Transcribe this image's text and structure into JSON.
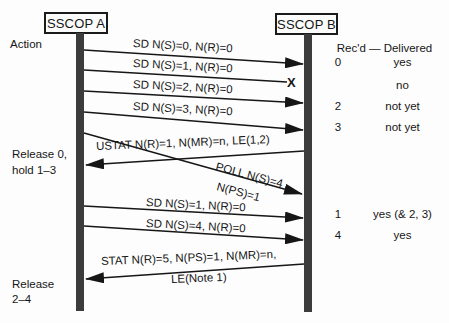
{
  "diagram": {
    "actors": [
      {
        "label": "SSCOP A"
      },
      {
        "label": "SSCOP B"
      }
    ],
    "left_labels": {
      "action": "Action",
      "release_hold_line1": "Release 0,",
      "release_hold_line2": "hold 1–3",
      "release2_line1": "Release",
      "release2_line2": "2–4"
    },
    "messages": [
      {
        "label": "SD N(S)=0, N(R)=0"
      },
      {
        "label": "SD N(S)=1, N(R)=0"
      },
      {
        "label": "SD N(S)=2, N(R)=0"
      },
      {
        "label": "SD N(S)=3, N(R)=0"
      },
      {
        "label": "USTAT N(R)=1, N(MR)=n, LE(1,2)"
      },
      {
        "label": "POLL N(S)=4",
        "label2": "N(PS)=1"
      },
      {
        "label": "SD N(S)=1, N(R)=0"
      },
      {
        "label": "SD N(S)=4, N(R)=0"
      },
      {
        "label": "STAT N(R)=5, N(PS)=1, N(MR)=n,",
        "label2": "LE(Note 1)"
      }
    ],
    "loss_marker": "X",
    "table": {
      "header": "Rec'd — Delivered",
      "rows": [
        {
          "recd": "0",
          "delivered": "yes"
        },
        {
          "recd": "",
          "delivered": "no"
        },
        {
          "recd": "2",
          "delivered": "not yet"
        },
        {
          "recd": "3",
          "delivered": "not yet"
        },
        {
          "recd": "1",
          "delivered": "yes (& 2, 3)"
        },
        {
          "recd": "4",
          "delivered": "yes"
        }
      ]
    },
    "colors": {
      "ink": "#161616",
      "lifeline": "#3c3c3c",
      "background": "#fdfdfd"
    }
  }
}
